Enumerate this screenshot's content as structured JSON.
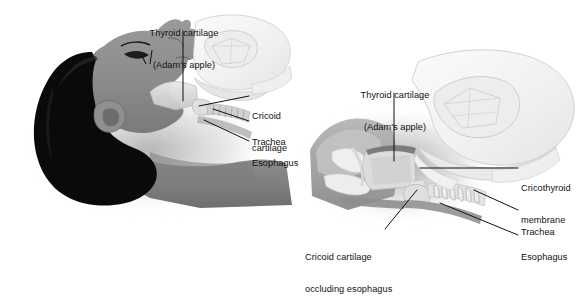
{
  "figure": {
    "title_visible": false,
    "background_color": "#ffffff",
    "panel_count": 2,
    "ink_color": "#111111",
    "palette": {
      "hair_black": "#0a0a0a",
      "skin_mid_gray": "#8d8d8d",
      "skin_shadow_gray": "#6f6f6f",
      "cartilage_light": "#d8d8d8",
      "cartilage_pale": "#ececec",
      "hand_ghost": "#f2f2f2",
      "hand_ghost_line": "#c9c9c9",
      "soft_shadow": "#bdbdbd"
    }
  },
  "left_panel": {
    "name": "lateral-head-neck-view",
    "labels": [
      {
        "id": "thyroid-cartilage",
        "line1": "Thyroid cartilage",
        "line2": "(Adam's apple)",
        "x": 134,
        "y": 7,
        "align": "center",
        "leader": {
          "type": "vertical",
          "x1": 183,
          "y1": 31,
          "x2": 183,
          "y2": 101
        }
      },
      {
        "id": "cricoid-cartilage",
        "line1": "Cricoid",
        "line2": "cartilage",
        "x": 252,
        "y": 90,
        "align": "left",
        "leader": {
          "type": "diagonal",
          "x1": 249,
          "y1": 96,
          "x2": 199,
          "y2": 106
        }
      },
      {
        "id": "trachea",
        "line1": "Trachea",
        "line2": "",
        "x": 252,
        "y": 116,
        "align": "left",
        "leader": {
          "type": "diagonal",
          "x1": 249,
          "y1": 121,
          "x2": 213,
          "y2": 109
        }
      },
      {
        "id": "esophagus",
        "line1": "Esophagus",
        "line2": "",
        "x": 252,
        "y": 137,
        "align": "left",
        "leader": {
          "type": "diagonal",
          "x1": 249,
          "y1": 141,
          "x2": 204,
          "y2": 120
        }
      }
    ]
  },
  "right_panel": {
    "name": "sagittal-larynx-closeup-view",
    "labels": [
      {
        "id": "thyroid-cartilage",
        "line1": "Thyroid cartilage",
        "line2": "(Adam's apple)",
        "x": 345,
        "y": 69,
        "align": "center",
        "leader": {
          "type": "vertical",
          "x1": 394,
          "y1": 93,
          "x2": 394,
          "y2": 161
        }
      },
      {
        "id": "cricothyroid-membrane",
        "line1": "Cricothyroid",
        "line2": "membrane",
        "x": 521,
        "y": 162,
        "align": "left",
        "leader": {
          "type": "horizontal",
          "x1": 518,
          "y1": 168,
          "x2": 420,
          "y2": 168
        }
      },
      {
        "id": "trachea",
        "line1": "Trachea",
        "line2": "",
        "x": 521,
        "y": 206,
        "align": "left",
        "leader": {
          "type": "diagonal",
          "x1": 518,
          "y1": 210,
          "x2": 474,
          "y2": 190
        }
      },
      {
        "id": "esophagus",
        "line1": "Esophagus",
        "line2": "",
        "x": 521,
        "y": 231,
        "align": "left",
        "leader": {
          "type": "diagonal",
          "x1": 518,
          "y1": 235,
          "x2": 440,
          "y2": 203
        }
      },
      {
        "id": "cricoid-cartilage-occluding-esophagus",
        "line1": "Cricoid cartilage",
        "line2": "occluding esophagus",
        "x": 305,
        "y": 231,
        "align": "left",
        "leader": {
          "type": "diagonal",
          "x1": 385,
          "y1": 229,
          "x2": 417,
          "y2": 190
        }
      }
    ]
  }
}
